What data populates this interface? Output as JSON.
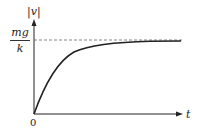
{
  "diagram": {
    "type": "velocity-time graph (terminal velocity approach)",
    "y_axis_label": "|v|",
    "x_axis_label": "t",
    "origin_label": "0",
    "asymptote_label": {
      "numerator": "mg",
      "denominator": "k"
    },
    "asymptote_style": "dashed",
    "curve": "exponential rise from origin approaching mg/k"
  },
  "colors": {
    "axes": "#222222",
    "curve": "#222222",
    "dashed_line": "#555555",
    "background": "#ffffff"
  }
}
